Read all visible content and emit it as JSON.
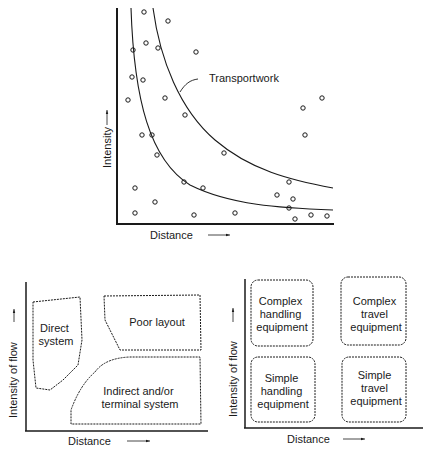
{
  "chart_data": [
    {
      "type": "scatter",
      "title": "",
      "xlabel": "Distance",
      "ylabel": "Intensity",
      "annotation": "Transportwork",
      "curves": [
        "inner hyperbola",
        "outer hyperbola (Transportwork)"
      ],
      "points": [
        [
          144,
          12
        ],
        [
          168,
          21
        ],
        [
          146,
          43
        ],
        [
          158,
          48
        ],
        [
          133,
          50
        ],
        [
          196,
          52
        ],
        [
          132,
          77
        ],
        [
          143,
          80
        ],
        [
          128,
          100
        ],
        [
          165,
          98
        ],
        [
          185,
          115
        ],
        [
          303,
          108
        ],
        [
          322,
          98
        ],
        [
          305,
          135
        ],
        [
          142,
          135
        ],
        [
          152,
          135
        ],
        [
          157,
          155
        ],
        [
          224,
          153
        ],
        [
          184,
          182
        ],
        [
          203,
          188
        ],
        [
          289,
          182
        ],
        [
          135,
          188
        ],
        [
          155,
          202
        ],
        [
          277,
          195
        ],
        [
          293,
          199
        ],
        [
          289,
          208
        ],
        [
          135,
          213
        ],
        [
          194,
          215
        ],
        [
          235,
          213
        ],
        [
          295,
          219
        ],
        [
          311,
          215
        ],
        [
          327,
          216
        ]
      ]
    },
    {
      "type": "diagram",
      "xlabel": "Distance",
      "ylabel": "Intensity of flow",
      "regions": [
        "Direct system",
        "Poor layout",
        "Indirect and/or terminal system"
      ]
    },
    {
      "type": "diagram",
      "xlabel": "Distance",
      "ylabel": "Intensity of flow",
      "regions": [
        "Complex handling equipment",
        "Complex travel equipment",
        "Simple handling equipment",
        "Simple travel equipment"
      ]
    }
  ],
  "top": {
    "annotation": "Transportwork",
    "xlabel": "Distance",
    "ylabel": "Intensity"
  },
  "left": {
    "xlabel": "Distance",
    "ylabel": "Intensity of flow",
    "direct": [
      "Direct",
      "system"
    ],
    "poor": "Poor layout",
    "indirect": [
      "Indirect and/or",
      "terminal system"
    ]
  },
  "right": {
    "xlabel": "Distance",
    "ylabel": "Intensity of flow",
    "ch": [
      "Complex",
      "handling",
      "equipment"
    ],
    "ct": [
      "Complex",
      "travel",
      "equipment"
    ],
    "sh": [
      "Simple",
      "handling",
      "equipment"
    ],
    "st": [
      "Simple",
      "travel",
      "equipment"
    ]
  }
}
